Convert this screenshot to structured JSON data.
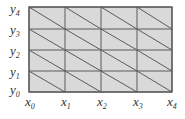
{
  "diagram": {
    "type": "triangulated-grid",
    "colors": {
      "fill": "#d9d9d9",
      "line": "#5a5a5a",
      "text": "#333333",
      "background": "#ffffff"
    },
    "x_labels": [
      {
        "base": "x",
        "sub": "0"
      },
      {
        "base": "x",
        "sub": "1"
      },
      {
        "base": "x",
        "sub": "2"
      },
      {
        "base": "x",
        "sub": "3"
      },
      {
        "base": "x",
        "sub": "4"
      }
    ],
    "y_labels": [
      {
        "base": "y",
        "sub": "0"
      },
      {
        "base": "y",
        "sub": "1"
      },
      {
        "base": "y",
        "sub": "2"
      },
      {
        "base": "y",
        "sub": "3"
      },
      {
        "base": "y",
        "sub": "4"
      }
    ],
    "grid": {
      "x_px": [
        29,
        65,
        101,
        137,
        172
      ],
      "y_px": [
        92,
        71,
        50,
        29,
        7
      ]
    }
  }
}
